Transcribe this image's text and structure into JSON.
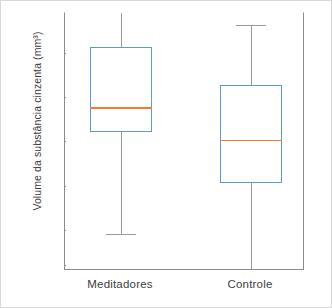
{
  "chart_data": {
    "type": "box",
    "title": "",
    "xlabel": "",
    "ylabel": "Volume da substância cinzenta (mm³)",
    "categories": [
      "Meditadores",
      "Controle"
    ],
    "ylim": [
      450,
      745
    ],
    "yticks": [
      700,
      650,
      600,
      550,
      500,
      150
    ],
    "ytick_labels": [
      "700",
      "650",
      "600",
      "550",
      "500",
      "150"
    ],
    "grid": false,
    "legend": "none",
    "boxes": [
      {
        "name": "Meditadores",
        "whisker_low": 496,
        "q1": 611,
        "median": 638,
        "q3": 707,
        "whisker_high": 745,
        "whisker_high_clipped": true,
        "box_color": "#5b9bd5",
        "median_color": "#ed7d31",
        "whisker_color": "#9a9a9a"
      },
      {
        "name": "Controle",
        "whisker_low": 157,
        "q1": 553,
        "median": 601,
        "q3": 664,
        "whisker_high": 731,
        "whisker_high_clipped": false,
        "box_color": "#5b9bd5",
        "median_color": "#ed7d31",
        "whisker_color": "#9a9a9a"
      }
    ]
  },
  "axis": {
    "y_title": "Volume da substância cinzenta (mm³)",
    "tick_0": "700",
    "tick_1": "650",
    "tick_2": "600",
    "tick_3": "550",
    "tick_4": "500",
    "tick_5": "150",
    "x_label_0": "Meditadores",
    "x_label_1": "Controle"
  },
  "colors": {
    "box": "#5b9bd5",
    "median": "#ed7d31",
    "whisker": "#9a9a9a",
    "axis": "#8c8c8c",
    "text": "#3d3d3d",
    "frame": "#d8d8d8",
    "background": "#ffffff"
  }
}
